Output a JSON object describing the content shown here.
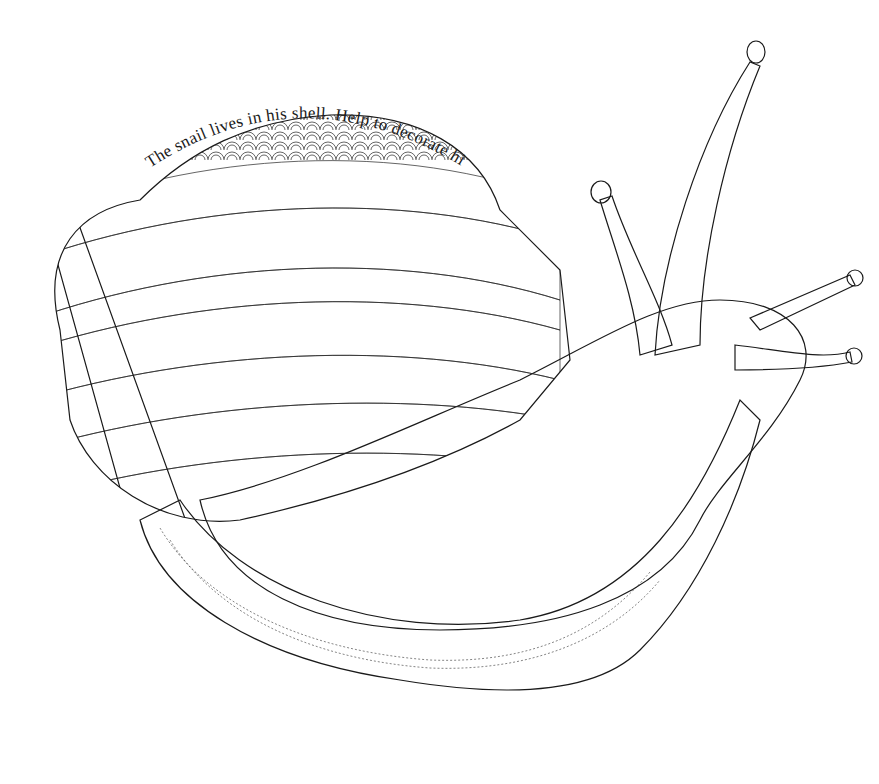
{
  "page": {
    "type": "coloring-page",
    "subject": "snail",
    "caption": "The snail lives in his shell. Help to decorate his home.",
    "ink_color": "#1a1a1a",
    "background_color": "#ffffff"
  },
  "illustration": {
    "parts": [
      {
        "name": "shell",
        "pattern": "zentangle bands: scallops, arcs, sawtooth, leaves, cross-hatch"
      },
      {
        "name": "body",
        "pattern": "woven lattice"
      },
      {
        "name": "foot-skirt",
        "pattern": "vertical stripes with dashed lines"
      },
      {
        "name": "upper-tentacles",
        "count": 2,
        "pattern": "horizontal rings with dashed lines"
      },
      {
        "name": "lower-tentacles",
        "count": 2,
        "pattern": "rings"
      }
    ]
  }
}
